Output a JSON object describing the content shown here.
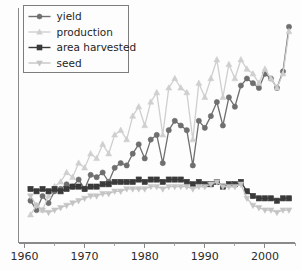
{
  "chart_data": {
    "type": "line",
    "title": "",
    "subtitle": "",
    "xlabel": "",
    "ylabel": "",
    "xlim": [
      1959,
      2005
    ],
    "ylim": [
      0,
      100
    ],
    "grid": false,
    "legend_position": "upper-left",
    "x": [
      1961,
      1962,
      1963,
      1964,
      1965,
      1966,
      1967,
      1968,
      1969,
      1970,
      1971,
      1972,
      1973,
      1974,
      1975,
      1976,
      1977,
      1978,
      1979,
      1980,
      1981,
      1982,
      1983,
      1984,
      1985,
      1986,
      1987,
      1988,
      1989,
      1990,
      1991,
      1992,
      1993,
      1994,
      1995,
      1996,
      1997,
      1998,
      1999,
      2000,
      2001,
      2002,
      2003,
      2004
    ],
    "series": [
      {
        "name": "yield",
        "color": "#6f6f6f",
        "marker": "circle",
        "values": [
          18,
          14,
          20,
          17,
          22,
          23,
          25,
          24,
          27,
          23,
          29,
          28,
          30,
          26,
          32,
          34,
          33,
          38,
          42,
          36,
          44,
          46,
          34,
          48,
          52,
          50,
          48,
          33,
          52,
          49,
          54,
          60,
          50,
          62,
          58,
          67,
          70,
          68,
          66,
          72,
          70,
          66,
          73,
          92
        ]
      },
      {
        "name": "production",
        "color": "#cfcfcf",
        "marker": "triangle-up",
        "values": [
          12,
          16,
          14,
          20,
          24,
          26,
          30,
          28,
          34,
          32,
          38,
          36,
          42,
          38,
          46,
          48,
          44,
          54,
          58,
          50,
          60,
          64,
          46,
          66,
          70,
          66,
          64,
          44,
          68,
          62,
          70,
          78,
          62,
          76,
          70,
          78,
          74,
          72,
          68,
          74,
          70,
          66,
          72,
          90
        ]
      },
      {
        "name": "area harvested",
        "color": "#3a3a3a",
        "marker": "square",
        "values": [
          23,
          22,
          23,
          22,
          23,
          22,
          23,
          24,
          24,
          23,
          24,
          24,
          25,
          25,
          26,
          26,
          26,
          26,
          27,
          26,
          27,
          27,
          26,
          27,
          27,
          27,
          26,
          25,
          26,
          25,
          25,
          26,
          24,
          25,
          25,
          26,
          22,
          20,
          19,
          19,
          19,
          18,
          19,
          19
        ]
      },
      {
        "name": "seed",
        "color": "#c4c4c4",
        "marker": "triangle-down",
        "values": [
          20,
          16,
          14,
          13,
          14,
          15,
          16,
          17,
          18,
          19,
          20,
          20,
          21,
          21,
          22,
          22,
          23,
          23,
          23,
          23,
          24,
          24,
          23,
          24,
          24,
          24,
          24,
          23,
          24,
          24,
          25,
          26,
          24,
          24,
          24,
          25,
          19,
          16,
          15,
          14,
          14,
          13,
          14,
          14
        ]
      }
    ],
    "x_ticks": [
      {
        "value": 1960,
        "label": "1960"
      },
      {
        "value": 1970,
        "label": "1970"
      },
      {
        "value": 1980,
        "label": "1980"
      },
      {
        "value": 1990,
        "label": "1990"
      },
      {
        "value": 2000,
        "label": "2000"
      }
    ],
    "x_minor_ticks": [
      1965,
      1975,
      1985,
      1995,
      2005
    ],
    "y_ticks": [],
    "legend": [
      {
        "label": "yield",
        "color": "#6f6f6f",
        "marker": "circle"
      },
      {
        "label": "production",
        "color": "#cfcfcf",
        "marker": "triangle-up"
      },
      {
        "label": "area harvested",
        "color": "#3a3a3a",
        "marker": "square"
      },
      {
        "label": "seed",
        "color": "#c4c4c4",
        "marker": "triangle-down"
      }
    ]
  },
  "colors": {
    "background": "#fdfdfd",
    "axis": "#8a8a8a",
    "text": "#2b2b2b",
    "legend_border": "#7d7d7d"
  }
}
